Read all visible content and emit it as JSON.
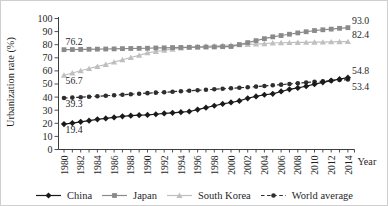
{
  "figure": {
    "background": "#ffffff",
    "border_color": "#cfcfcf"
  },
  "chart_data": {
    "type": "line",
    "title": "",
    "ylabel": "Urbanization rate (%)",
    "xlabel": "Year",
    "ylim": [
      0,
      100
    ],
    "y_ticks": [
      0,
      10,
      20,
      30,
      40,
      50,
      60,
      70,
      80,
      90,
      100
    ],
    "grid": false,
    "legend_position": "bottom",
    "axis_color": "#3d3d3d",
    "text_color": "#1f1f1f",
    "x_label_step": 2,
    "x": [
      1980,
      1981,
      1982,
      1983,
      1984,
      1985,
      1986,
      1987,
      1988,
      1989,
      1990,
      1991,
      1992,
      1993,
      1994,
      1995,
      1996,
      1997,
      1998,
      1999,
      2000,
      2001,
      2002,
      2003,
      2004,
      2005,
      2006,
      2007,
      2008,
      2009,
      2010,
      2011,
      2012,
      2013,
      2014
    ],
    "x_tick_labels": [
      "1980",
      "1982",
      "1984",
      "1986",
      "1988",
      "1990",
      "1992",
      "1994",
      "1996",
      "1998",
      "2000",
      "2002",
      "2004",
      "2006",
      "2008",
      "2010",
      "2012",
      "2014"
    ],
    "series": [
      {
        "name": "China",
        "color": "#1a1a1a",
        "marker": "diamond",
        "line_style": "solid",
        "z": 4,
        "start_label": "19.4",
        "start_label_side": "below",
        "end_label": "54.8",
        "end_label_side": "above",
        "values": [
          19.4,
          20.2,
          21.1,
          22.0,
          23.0,
          23.7,
          24.5,
          25.3,
          25.8,
          26.2,
          26.4,
          26.9,
          27.5,
          28.0,
          28.5,
          29.0,
          30.5,
          31.9,
          33.4,
          34.8,
          35.9,
          37.1,
          39.1,
          40.5,
          41.8,
          42.5,
          44.3,
          45.9,
          47.0,
          48.3,
          49.9,
          51.3,
          52.6,
          53.7,
          54.8
        ]
      },
      {
        "name": "Japan",
        "color": "#8a8a8a",
        "marker": "square",
        "line_style": "solid",
        "z": 2,
        "start_label": "76.2",
        "start_label_side": "above",
        "end_label": "93.0",
        "end_label_side": "above",
        "values": [
          76.2,
          76.3,
          76.4,
          76.5,
          76.6,
          76.7,
          76.8,
          77.0,
          77.1,
          77.2,
          77.3,
          77.5,
          77.6,
          77.8,
          77.9,
          78.0,
          78.1,
          78.2,
          78.3,
          78.5,
          78.6,
          80.1,
          81.6,
          83.1,
          84.6,
          86.0,
          87.0,
          88.0,
          89.0,
          89.9,
          90.8,
          91.4,
          91.9,
          92.5,
          93.0
        ]
      },
      {
        "name": "South Korea",
        "color": "#bfbfbf",
        "marker": "triangle",
        "line_style": "solid",
        "z": 1,
        "start_label": "56.7",
        "start_label_side": "below",
        "end_label": "82.4",
        "end_label_side": "above",
        "values": [
          56.7,
          58.4,
          60.1,
          61.8,
          63.4,
          64.9,
          66.7,
          68.5,
          70.2,
          71.9,
          73.8,
          74.8,
          75.7,
          76.6,
          77.4,
          78.2,
          78.5,
          78.8,
          79.1,
          79.4,
          79.6,
          79.9,
          80.2,
          80.5,
          80.8,
          81.3,
          81.5,
          81.6,
          81.7,
          81.8,
          81.9,
          82.0,
          82.2,
          82.3,
          82.4
        ]
      },
      {
        "name": "World average",
        "color": "#2e2e2e",
        "marker": "circle",
        "line_style": "dashed",
        "z": 3,
        "start_label": "39.3",
        "start_label_side": "below",
        "end_label": "53.4",
        "end_label_side": "below",
        "values": [
          39.3,
          39.6,
          39.9,
          40.3,
          40.6,
          41.0,
          41.4,
          41.8,
          42.2,
          42.6,
          43.0,
          43.4,
          43.7,
          44.1,
          44.5,
          44.8,
          45.2,
          45.6,
          46.0,
          46.4,
          46.7,
          47.1,
          47.5,
          48.0,
          48.5,
          49.0,
          49.5,
          50.0,
          50.6,
          51.1,
          51.7,
          52.1,
          52.5,
          53.0,
          53.4
        ]
      }
    ]
  }
}
